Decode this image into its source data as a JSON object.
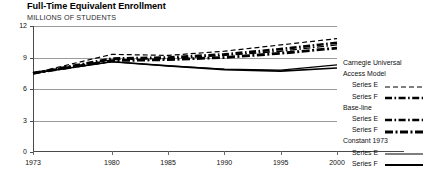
{
  "chart_data": {
    "type": "line",
    "title": "Full-Time Equivalent Enrollment",
    "subtitle": "MILLIONS OF STUDENTS",
    "xlabel": "",
    "ylabel": "MILLIONS OF STUDENTS",
    "xlim": [
      1973,
      2000
    ],
    "ylim": [
      0,
      12
    ],
    "yticks": [
      0,
      3,
      6,
      9,
      12
    ],
    "xticks": [
      1973,
      1980,
      1985,
      1990,
      1995,
      2000
    ],
    "grid": true,
    "legend_position": "right",
    "x": [
      1973,
      1980,
      1985,
      1990,
      1995,
      2000
    ],
    "series": [
      {
        "name": "Carnegie Universal Access Model — Series E",
        "group": "Carnegie Universal Access Model",
        "label": "Series E",
        "style": "dashed",
        "width": 1.2,
        "values": [
          7.5,
          9.3,
          9.2,
          9.6,
          10.2,
          10.8
        ]
      },
      {
        "name": "Carnegie Universal Access Model — Series F",
        "group": "Carnegie Universal Access Model",
        "label": "Series F",
        "style": "dash-dot",
        "width": 2.6,
        "values": [
          7.5,
          8.9,
          9.0,
          9.3,
          9.8,
          10.4
        ]
      },
      {
        "name": "Base-line — Series E",
        "group": "Base-line",
        "label": "Series E",
        "style": "dash-dot",
        "width": 1.4,
        "values": [
          7.5,
          8.8,
          8.9,
          9.2,
          9.6,
          10.2
        ]
      },
      {
        "name": "Base-line — Series F",
        "group": "Base-line",
        "label": "Series F",
        "style": "dash-dot-heavy",
        "width": 2.8,
        "values": [
          7.5,
          8.7,
          8.8,
          9.0,
          9.4,
          9.9
        ]
      },
      {
        "name": "Constant 1973 — Series E",
        "group": "Constant 1973",
        "label": "Series E",
        "style": "solid",
        "width": 1.1,
        "values": [
          7.5,
          8.6,
          8.2,
          7.9,
          7.8,
          8.3
        ]
      },
      {
        "name": "Constant 1973 — Series F",
        "group": "Constant 1973",
        "label": "Series F",
        "style": "solid",
        "width": 1.6,
        "values": [
          7.5,
          8.6,
          8.2,
          7.85,
          7.7,
          8.0
        ]
      }
    ],
    "legend": [
      {
        "group": "Carnegie Universal Access Model",
        "head_line_1": "Carnegie Universal",
        "head_line_2": "Access Model",
        "entries": [
          {
            "label": "Series E",
            "style": "dashed"
          },
          {
            "label": "Series F",
            "style": "dash-dot"
          }
        ]
      },
      {
        "group": "Base-line",
        "head_line_1": "Base-line",
        "entries": [
          {
            "label": "Series E",
            "style": "dash-dot"
          },
          {
            "label": "Series F",
            "style": "dash-dot-heavy"
          }
        ]
      },
      {
        "group": "Constant 1973",
        "head_line_1": "Constant 1973",
        "entries": [
          {
            "label": "Series E",
            "style": "solid"
          },
          {
            "label": "Series F",
            "style": "solid-heavy"
          }
        ]
      }
    ],
    "colors": {
      "line": "#000000",
      "grid": "#9a9a9a",
      "axis": "#4a4a4a",
      "background": "#ffffff"
    }
  }
}
